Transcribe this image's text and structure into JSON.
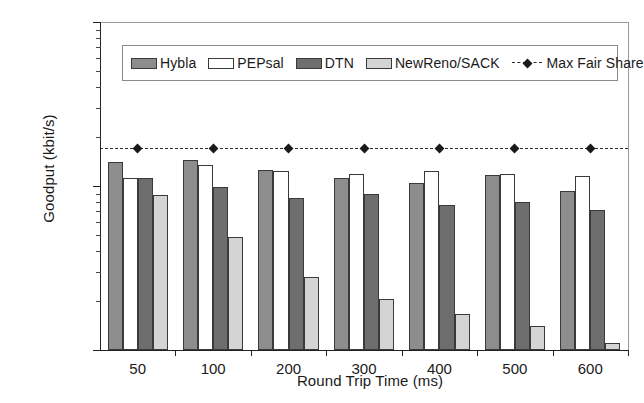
{
  "chart_data": {
    "type": "bar",
    "title": "",
    "xlabel": "Round Trip Time (ms)",
    "ylabel": "Goodput (kbit/s)",
    "categories": [
      "50",
      "100",
      "200",
      "300",
      "400",
      "500",
      "600"
    ],
    "yscale": "log",
    "ylim": [
      100,
      10000
    ],
    "ytick_labels": [
      "100",
      "1000",
      "10000"
    ],
    "ytick_values": [
      100,
      1000,
      10000
    ],
    "grid": false,
    "legend_position": "top-inside",
    "series": [
      {
        "name": "Hybla",
        "type": "bar",
        "color": "#8d8d8d",
        "values": [
          1400,
          1450,
          1250,
          1120,
          1040,
          1170,
          930
        ]
      },
      {
        "name": "PEPsal",
        "type": "bar",
        "color": "#ffffff",
        "values": [
          1120,
          1350,
          1240,
          1180,
          1230,
          1180,
          1150
        ]
      },
      {
        "name": "DTN",
        "type": "bar",
        "color": "#6e6e6e",
        "values": [
          1120,
          990,
          840,
          890,
          770,
          800,
          710
        ]
      },
      {
        "name": "NewReno/SACK",
        "type": "bar",
        "color": "#d4d4d4",
        "values": [
          880,
          490,
          280,
          205,
          165,
          140,
          110
        ]
      },
      {
        "name": "Max Fair Share",
        "type": "line",
        "color": "#1a1a1a",
        "values": [
          1700,
          1700,
          1700,
          1700,
          1700,
          1700,
          1700
        ]
      }
    ]
  },
  "legend": {
    "items": [
      {
        "label": "Hybla",
        "marker": "swatch-gray"
      },
      {
        "label": "PEPsal",
        "marker": "swatch-white"
      },
      {
        "label": "DTN",
        "marker": "swatch-dark-gray"
      },
      {
        "label": "NewReno/SACK",
        "marker": "swatch-light-gray"
      },
      {
        "label": "Max Fair Share",
        "marker": "dashed-line-diamond"
      }
    ]
  },
  "axes": {
    "y": {
      "label": "Goodput (kbit/s)",
      "ticks": [
        "10000",
        "1000",
        "100"
      ]
    },
    "x": {
      "label": "Round Trip Time (ms)",
      "ticks": [
        "50",
        "100",
        "200",
        "300",
        "400",
        "500",
        "600"
      ]
    }
  }
}
